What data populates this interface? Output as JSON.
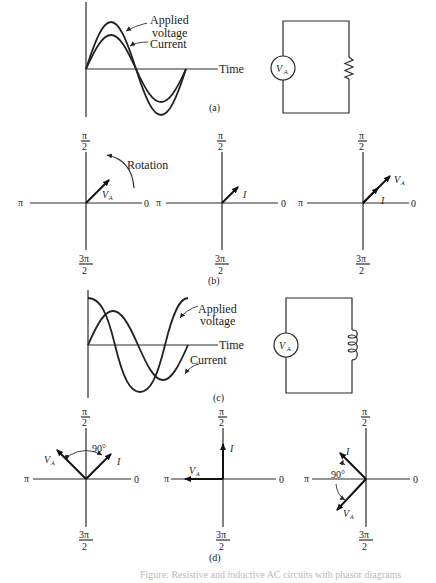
{
  "figure": {
    "caption": "Figure: Resistive and inductive AC circuits with phasor diagrams",
    "panels": {
      "a": {
        "label": "(a)",
        "graph": {
          "time_axis_label": "Time",
          "curve_labels": {
            "voltage": "Applied voltage",
            "voltage_line1": "Applied",
            "voltage_line2": "voltage",
            "current": "Current"
          },
          "relation": "in phase"
        },
        "circuit": {
          "source_label": "V",
          "source_subscript": "A",
          "load": "resistor"
        }
      },
      "b": {
        "label": "(b)",
        "axis_labels": {
          "top": "π",
          "top_den": "2",
          "left": "π",
          "right": "0",
          "bottom": "3π",
          "bottom_den": "2"
        },
        "diagrams": [
          {
            "vector_labels": [
              "V",
              "I"
            ],
            "v_sub": "A",
            "annotation": "Rotation",
            "angles_deg": {
              "V": 40
            }
          },
          {
            "vector_labels": [
              "I"
            ],
            "angles_deg": {
              "I": 40
            }
          },
          {
            "vector_labels": [
              "V",
              "I"
            ],
            "v_sub": "A",
            "angles_deg": {
              "V": 40,
              "I": 40
            }
          }
        ]
      },
      "c": {
        "label": "(c)",
        "graph": {
          "time_axis_label": "Time",
          "curve_labels": {
            "voltage_line1": "Applied",
            "voltage_line2": "voltage",
            "current": "Current"
          },
          "relation": "current lags voltage by 90°"
        },
        "circuit": {
          "source_label": "V",
          "source_subscript": "A",
          "load": "inductor"
        }
      },
      "d": {
        "label": "(d)",
        "angle_label": "90°",
        "diagrams": [
          {
            "angles_deg": {
              "V": 135,
              "I": 45
            }
          },
          {
            "angles_deg": {
              "V": 180,
              "I": 90
            }
          },
          {
            "angles_deg": {
              "I": 135,
              "V": 225
            }
          }
        ],
        "vector_names": {
          "voltage": "V",
          "voltage_sub": "A",
          "current": "I"
        }
      }
    }
  }
}
